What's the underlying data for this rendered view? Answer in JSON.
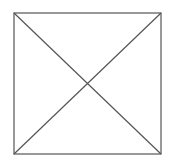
{
  "diagram": {
    "canvas": {
      "width": 170,
      "height": 167,
      "background": "#ffffff"
    },
    "stroke": {
      "color": "#555555",
      "width": 1.2
    },
    "square": {
      "x": 14,
      "y": 13,
      "width": 147,
      "height": 141
    },
    "diagonals": [
      {
        "x1": 14,
        "y1": 13,
        "x2": 161,
        "y2": 154
      },
      {
        "x1": 161,
        "y1": 13,
        "x2": 14,
        "y2": 154
      }
    ]
  }
}
